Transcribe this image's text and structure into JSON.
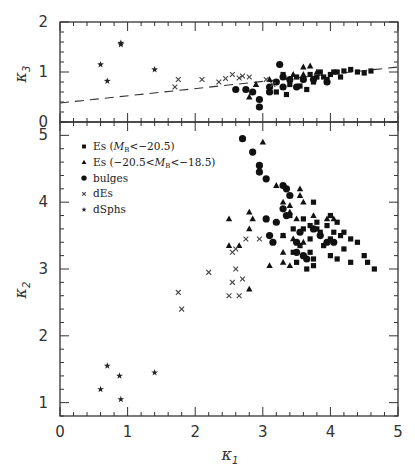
{
  "chart_data": [
    {
      "type": "scatter",
      "panel": "top",
      "xlabel": "κ1",
      "ylabel": "κ3",
      "xlim": [
        0,
        5
      ],
      "ylim": [
        0,
        2
      ],
      "yticks": [
        "0",
        "1",
        "2"
      ],
      "grid": false,
      "fit_line": {
        "style": "dashed",
        "x": [
          0,
          5
        ],
        "y": [
          0.38,
          1.1
        ]
      },
      "series": [
        {
          "name": "Es (M_B<-20.5)",
          "marker": "square",
          "points": [
            [
              3.3,
              0.95
            ],
            [
              3.5,
              0.9
            ],
            [
              3.6,
              0.85
            ],
            [
              3.7,
              0.95
            ],
            [
              3.8,
              0.9
            ],
            [
              3.85,
              1.0
            ],
            [
              3.9,
              0.9
            ],
            [
              4.0,
              0.95
            ],
            [
              4.05,
              1.0
            ],
            [
              4.1,
              1.0
            ],
            [
              4.2,
              1.02
            ],
            [
              4.3,
              1.05
            ],
            [
              4.4,
              1.0
            ],
            [
              4.5,
              0.98
            ],
            [
              4.6,
              1.02
            ],
            [
              3.4,
              0.75
            ],
            [
              3.55,
              0.72
            ],
            [
              3.75,
              0.8
            ],
            [
              3.95,
              0.85
            ],
            [
              4.15,
              0.9
            ],
            [
              3.2,
              0.6
            ],
            [
              3.35,
              0.55
            ],
            [
              3.65,
              0.65
            ]
          ]
        },
        {
          "name": "Es (-20.5<M_B<-18.5)",
          "marker": "triangle",
          "points": [
            [
              2.8,
              0.5
            ],
            [
              2.9,
              0.75
            ],
            [
              3.1,
              0.85
            ],
            [
              3.6,
              1.1
            ],
            [
              3.7,
              1.12
            ],
            [
              3.45,
              0.95
            ],
            [
              3.6,
              0.95
            ],
            [
              3.8,
              1.0
            ]
          ]
        },
        {
          "name": "bulges",
          "marker": "circle",
          "points": [
            [
              2.6,
              0.65
            ],
            [
              2.75,
              0.65
            ],
            [
              2.85,
              0.6
            ],
            [
              2.95,
              0.45
            ],
            [
              2.95,
              0.3
            ],
            [
              3.1,
              0.7
            ],
            [
              3.2,
              0.8
            ],
            [
              3.25,
              1.15
            ],
            [
              3.3,
              0.9
            ],
            [
              3.4,
              0.85
            ],
            [
              3.5,
              0.7
            ],
            [
              3.6,
              0.85
            ],
            [
              3.75,
              0.85
            ],
            [
              3.95,
              0.8
            ],
            [
              3.1,
              0.6
            ],
            [
              3.3,
              0.7
            ]
          ]
        },
        {
          "name": "dEs",
          "marker": "x",
          "points": [
            [
              1.7,
              0.7
            ],
            [
              1.75,
              0.85
            ],
            [
              2.1,
              0.85
            ],
            [
              2.35,
              0.8
            ],
            [
              2.45,
              0.87
            ],
            [
              2.55,
              0.95
            ],
            [
              2.65,
              0.88
            ],
            [
              2.7,
              0.92
            ],
            [
              2.8,
              0.9
            ],
            [
              3.05,
              0.85
            ],
            [
              3.15,
              0.75
            ]
          ]
        },
        {
          "name": "dSphs",
          "marker": "star",
          "points": [
            [
              0.6,
              1.15
            ],
            [
              0.7,
              0.82
            ],
            [
              0.9,
              1.58
            ],
            [
              0.9,
              1.55
            ],
            [
              1.4,
              1.05
            ]
          ]
        }
      ]
    },
    {
      "type": "scatter",
      "panel": "bottom",
      "xlabel": "κ1",
      "ylabel": "κ2",
      "xlim": [
        0,
        5
      ],
      "ylim": [
        0.8,
        5.2
      ],
      "xticks": [
        "0",
        "1",
        "2",
        "3",
        "4",
        "5"
      ],
      "yticks": [
        "1",
        "2",
        "3",
        "4",
        "5"
      ],
      "grid": false,
      "legend": {
        "position": "upper-left",
        "entries": [
          {
            "marker": "square",
            "label": "Es (",
            "math": "M",
            "sub": "B",
            "tail": "<−20.5)"
          },
          {
            "marker": "triangle",
            "label": "Es (−20.5<",
            "math": "M",
            "sub": "B",
            "tail": "<−18.5)"
          },
          {
            "marker": "circle",
            "label": "bulges"
          },
          {
            "marker": "x",
            "label": "dEs"
          },
          {
            "marker": "star",
            "label": "dSphs"
          }
        ]
      },
      "series": [
        {
          "name": "Es (M_B<-20.5)",
          "marker": "square",
          "points": [
            [
              3.75,
              4.0
            ],
            [
              4.0,
              3.8
            ],
            [
              3.6,
              3.75
            ],
            [
              3.8,
              3.7
            ],
            [
              3.95,
              3.65
            ],
            [
              4.1,
              3.7
            ],
            [
              4.05,
              3.55
            ],
            [
              3.85,
              3.55
            ],
            [
              3.7,
              3.45
            ],
            [
              3.6,
              3.6
            ],
            [
              4.0,
              3.45
            ],
            [
              4.15,
              3.5
            ],
            [
              4.3,
              3.45
            ],
            [
              4.4,
              3.4
            ],
            [
              4.2,
              3.3
            ],
            [
              3.55,
              3.35
            ],
            [
              3.7,
              3.25
            ],
            [
              3.9,
              3.35
            ],
            [
              4.0,
              3.2
            ],
            [
              4.1,
              3.15
            ],
            [
              4.3,
              3.1
            ],
            [
              4.5,
              3.2
            ],
            [
              4.55,
              3.1
            ],
            [
              4.65,
              3.0
            ],
            [
              3.45,
              3.25
            ],
            [
              3.5,
              3.1
            ],
            [
              3.65,
              3.0
            ],
            [
              3.75,
              3.05
            ],
            [
              3.75,
              3.15
            ],
            [
              3.3,
              3.5
            ],
            [
              3.45,
              3.6
            ],
            [
              3.4,
              3.8
            ],
            [
              3.8,
              3.6
            ],
            [
              4.2,
              3.55
            ],
            [
              3.7,
              3.65
            ]
          ]
        },
        {
          "name": "Es (-20.5<M_B<-18.5)",
          "marker": "triangle",
          "points": [
            [
              3.0,
              4.9
            ],
            [
              3.2,
              4.25
            ],
            [
              2.5,
              3.75
            ],
            [
              2.8,
              3.85
            ],
            [
              2.85,
              3.75
            ],
            [
              3.3,
              4.0
            ],
            [
              3.4,
              3.95
            ],
            [
              3.4,
              3.85
            ],
            [
              3.5,
              3.75
            ],
            [
              3.55,
              4.2
            ],
            [
              3.55,
              4.1
            ],
            [
              3.6,
              4.0
            ],
            [
              3.75,
              3.8
            ],
            [
              2.8,
              3.6
            ],
            [
              2.5,
              3.35
            ],
            [
              2.65,
              3.35
            ],
            [
              3.45,
              3.45
            ],
            [
              3.3,
              3.5
            ],
            [
              3.6,
              3.4
            ],
            [
              3.3,
              3.25
            ],
            [
              3.1,
              3.05
            ],
            [
              3.3,
              3.1
            ],
            [
              3.4,
              3.05
            ],
            [
              2.8,
              2.7
            ],
            [
              3.95,
              3.75
            ],
            [
              4.05,
              3.75
            ]
          ]
        },
        {
          "name": "bulges",
          "marker": "circle",
          "points": [
            [
              2.7,
              4.95
            ],
            [
              2.85,
              4.75
            ],
            [
              2.95,
              4.55
            ],
            [
              2.95,
              4.45
            ],
            [
              3.05,
              4.35
            ],
            [
              3.3,
              4.25
            ],
            [
              3.35,
              4.2
            ],
            [
              3.4,
              4.1
            ],
            [
              3.3,
              3.9
            ],
            [
              3.35,
              3.8
            ],
            [
              3.05,
              3.75
            ],
            [
              3.1,
              3.5
            ],
            [
              3.15,
              3.4
            ],
            [
              3.2,
              3.7
            ],
            [
              3.5,
              3.4
            ],
            [
              3.55,
              3.55
            ],
            [
              3.6,
              3.2
            ],
            [
              3.65,
              3.15
            ],
            [
              3.75,
              3.6
            ],
            [
              3.85,
              3.5
            ],
            [
              3.95,
              3.4
            ],
            [
              4.05,
              3.4
            ],
            [
              3.5,
              3.25
            ]
          ]
        },
        {
          "name": "dEs",
          "marker": "x",
          "points": [
            [
              1.75,
              2.65
            ],
            [
              1.8,
              2.4
            ],
            [
              2.2,
              2.95
            ],
            [
              2.5,
              2.6
            ],
            [
              2.55,
              2.8
            ],
            [
              2.6,
              3.0
            ],
            [
              2.65,
              2.6
            ],
            [
              2.7,
              2.85
            ],
            [
              2.55,
              3.25
            ],
            [
              2.75,
              3.45
            ],
            [
              2.95,
              3.45
            ],
            [
              2.6,
              3.3
            ]
          ]
        },
        {
          "name": "dSphs",
          "marker": "star",
          "points": [
            [
              0.6,
              1.2
            ],
            [
              0.7,
              1.55
            ],
            [
              0.88,
              1.4
            ],
            [
              0.9,
              1.05
            ],
            [
              1.4,
              1.45
            ]
          ]
        }
      ]
    }
  ]
}
